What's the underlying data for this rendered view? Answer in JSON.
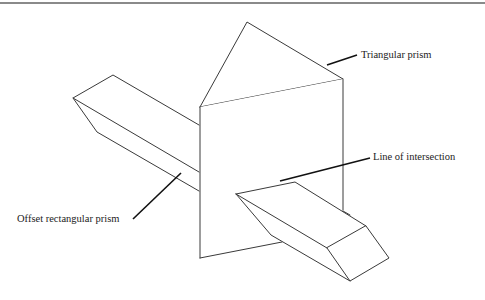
{
  "figure": {
    "labels": {
      "triangular_prism": "Triangular prism",
      "line_of_intersection": "Line of intersection",
      "offset_rectangular_prism": "Offset rectangular prism"
    },
    "colors": {
      "edge": "#3a3a3a",
      "leader": "#111111",
      "rule": "#8a8a8a",
      "background": "#ffffff"
    }
  }
}
